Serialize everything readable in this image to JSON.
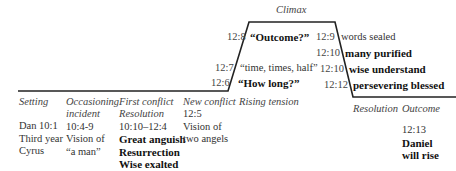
{
  "diagram": {
    "type": "narrative plot arc (Freytag-style)",
    "stages": [
      {
        "label": "Setting",
        "lines": [
          "Dan 10:1",
          "Third year",
          "Cyrus"
        ],
        "bold_lines": []
      },
      {
        "label": [
          "Occasioning",
          "incident"
        ],
        "lines": [
          "10:4-9",
          "Vision of",
          "“a man”"
        ],
        "bold_lines": []
      },
      {
        "label": [
          "First conflict",
          "Resolution"
        ],
        "lines": [
          "10:10–12:4"
        ],
        "bold_lines": [
          "Great anguish",
          "Resurrection",
          "Wise exalted"
        ]
      },
      {
        "label": "New conflict",
        "lines": [
          "12:5",
          "Vision of",
          "two angels"
        ],
        "bold_lines": []
      },
      {
        "label": "Rising tension"
      },
      {
        "label": "Resolution"
      },
      {
        "label": "Outcome",
        "lines": [
          "12:13"
        ],
        "bold_lines": [
          "Daniel",
          "will rise"
        ]
      }
    ],
    "climax_label": "Climax",
    "rising": [
      {
        "ref": "12:8",
        "text": "“Outcome?”",
        "bold": true
      },
      {
        "ref": "12:7",
        "text": "“time, times, half”",
        "bold": false
      },
      {
        "ref": "12:6",
        "text": "“How long?”",
        "bold": true
      }
    ],
    "falling": [
      {
        "ref": "12:9",
        "text": "words sealed",
        "bold": false
      },
      {
        "ref": "12:10",
        "text": "many purified",
        "bold": true
      },
      {
        "ref": "12:10",
        "text": "wise understand",
        "bold": true
      },
      {
        "ref": "12:12",
        "text": "persevering blessed",
        "bold": true
      }
    ]
  }
}
